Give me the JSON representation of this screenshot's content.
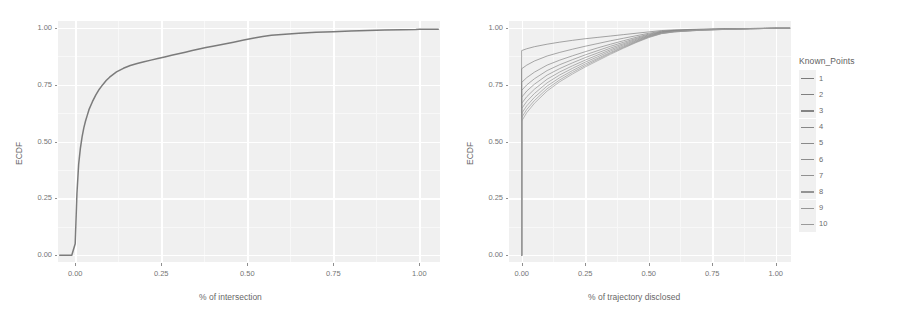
{
  "figure": {
    "background_color": "#ffffff",
    "panel_background_color": "#ececec",
    "gridline_color": "#ffffff",
    "curve_color": "#4a4a4a"
  },
  "legend": {
    "title": "Known_Points",
    "items": [
      {
        "label": "1",
        "color": "#575757"
      },
      {
        "label": "2",
        "color": "#5d5d5d"
      },
      {
        "label": "3",
        "color": "#626262"
      },
      {
        "label": "4",
        "color": "#666666"
      },
      {
        "label": "5",
        "color": "#6a6a6a"
      },
      {
        "label": "6",
        "color": "#6e6e6e"
      },
      {
        "label": "7",
        "color": "#727272"
      },
      {
        "label": "8",
        "color": "#767676"
      },
      {
        "label": "9",
        "color": "#7a7a7a"
      },
      {
        "label": "10",
        "color": "#7e7e7e"
      }
    ]
  },
  "chart_data": [
    {
      "type": "line",
      "panel": "left",
      "title": "",
      "xlabel": "% of intersection",
      "ylabel": "ECDF",
      "xlim": [
        -0.05,
        1.06
      ],
      "ylim": [
        -0.03,
        1.03
      ],
      "xticks": [
        0.0,
        0.25,
        0.5,
        0.75,
        1.0
      ],
      "xticklabels": [
        "0.00",
        "0.25",
        "0.50",
        "0.75",
        "1.00"
      ],
      "yticks": [
        0.0,
        0.25,
        0.5,
        0.75,
        1.0
      ],
      "yticklabels": [
        "0.00",
        "0.25",
        "0.50",
        "0.75",
        "1.00"
      ],
      "grid": true,
      "legend": false,
      "series": [
        {
          "name": "ECDF of % of intersection",
          "color": "#4a4a4a",
          "x": [
            -0.045,
            -0.01,
            0.0,
            0.002,
            0.005,
            0.01,
            0.015,
            0.02,
            0.025,
            0.03,
            0.035,
            0.04,
            0.05,
            0.06,
            0.07,
            0.08,
            0.09,
            0.1,
            0.12,
            0.14,
            0.16,
            0.18,
            0.2,
            0.22,
            0.24,
            0.26,
            0.28,
            0.3,
            0.32,
            0.34,
            0.36,
            0.38,
            0.4,
            0.43,
            0.46,
            0.49,
            0.52,
            0.545,
            0.57,
            0.6,
            0.65,
            0.7,
            0.75,
            0.8,
            0.85,
            0.9,
            0.95,
            0.99,
            1.0,
            1.055
          ],
          "y": [
            0.0,
            0.0,
            0.05,
            0.14,
            0.27,
            0.4,
            0.47,
            0.52,
            0.56,
            0.59,
            0.615,
            0.64,
            0.675,
            0.705,
            0.73,
            0.75,
            0.768,
            0.783,
            0.806,
            0.822,
            0.834,
            0.843,
            0.851,
            0.858,
            0.865,
            0.872,
            0.879,
            0.886,
            0.893,
            0.9,
            0.907,
            0.913,
            0.919,
            0.928,
            0.937,
            0.946,
            0.955,
            0.962,
            0.967,
            0.971,
            0.976,
            0.98,
            0.983,
            0.986,
            0.988,
            0.99,
            0.992,
            0.993,
            0.994,
            0.994
          ]
        }
      ]
    },
    {
      "type": "line",
      "panel": "right",
      "title": "",
      "xlabel": "% of trajectory disclosed",
      "ylabel": "ECDF",
      "xlim": [
        -0.05,
        1.06
      ],
      "ylim": [
        -0.03,
        1.03
      ],
      "xticks": [
        0.0,
        0.25,
        0.5,
        0.75,
        1.0
      ],
      "xticklabels": [
        "0.00",
        "0.25",
        "0.50",
        "0.75",
        "1.00"
      ],
      "yticks": [
        0.0,
        0.25,
        0.5,
        0.75,
        1.0
      ],
      "yticklabels": [
        "0.00",
        "0.25",
        "0.50",
        "0.75",
        "1.00"
      ],
      "grid": true,
      "legend": true,
      "legend_position": "right",
      "legend_title": "Known_Points",
      "series": [
        {
          "name": "1",
          "color": "#575757",
          "x": [
            0.0,
            0.0,
            0.02,
            0.05,
            0.1,
            0.15,
            0.2,
            0.25,
            0.3,
            0.35,
            0.4,
            0.45,
            0.5,
            0.55,
            0.6,
            0.7,
            0.8,
            0.9,
            1.0,
            1.055
          ],
          "y": [
            0.0,
            0.9,
            0.908,
            0.917,
            0.928,
            0.937,
            0.945,
            0.952,
            0.958,
            0.964,
            0.97,
            0.976,
            0.982,
            0.988,
            0.991,
            0.994,
            0.996,
            0.997,
            0.998,
            0.998
          ]
        },
        {
          "name": "2",
          "color": "#5d5d5d",
          "x": [
            0.0,
            0.0,
            0.02,
            0.05,
            0.1,
            0.15,
            0.2,
            0.25,
            0.3,
            0.35,
            0.4,
            0.45,
            0.5,
            0.55,
            0.6,
            0.7,
            0.8,
            0.9,
            1.0,
            1.055
          ],
          "y": [
            0.0,
            0.82,
            0.836,
            0.854,
            0.876,
            0.892,
            0.906,
            0.919,
            0.931,
            0.943,
            0.954,
            0.965,
            0.976,
            0.985,
            0.989,
            0.993,
            0.995,
            0.997,
            0.998,
            0.998
          ]
        },
        {
          "name": "3",
          "color": "#626262",
          "x": [
            0.0,
            0.0,
            0.02,
            0.05,
            0.1,
            0.15,
            0.2,
            0.25,
            0.3,
            0.35,
            0.4,
            0.45,
            0.5,
            0.55,
            0.6,
            0.7,
            0.8,
            0.9,
            1.0,
            1.055
          ],
          "y": [
            0.0,
            0.76,
            0.781,
            0.805,
            0.836,
            0.858,
            0.877,
            0.895,
            0.912,
            0.928,
            0.943,
            0.958,
            0.972,
            0.983,
            0.988,
            0.992,
            0.995,
            0.997,
            0.998,
            0.998
          ]
        },
        {
          "name": "4",
          "color": "#666666",
          "x": [
            0.0,
            0.0,
            0.02,
            0.05,
            0.1,
            0.15,
            0.2,
            0.25,
            0.3,
            0.35,
            0.4,
            0.45,
            0.5,
            0.55,
            0.6,
            0.7,
            0.8,
            0.9,
            1.0,
            1.055
          ],
          "y": [
            0.0,
            0.725,
            0.749,
            0.776,
            0.812,
            0.838,
            0.86,
            0.881,
            0.9,
            0.919,
            0.936,
            0.953,
            0.969,
            0.981,
            0.987,
            0.992,
            0.995,
            0.997,
            0.998,
            0.998
          ]
        },
        {
          "name": "5",
          "color": "#6a6a6a",
          "x": [
            0.0,
            0.0,
            0.02,
            0.05,
            0.1,
            0.15,
            0.2,
            0.25,
            0.3,
            0.35,
            0.4,
            0.45,
            0.5,
            0.55,
            0.6,
            0.7,
            0.8,
            0.9,
            1.0,
            1.055
          ],
          "y": [
            0.0,
            0.695,
            0.722,
            0.752,
            0.792,
            0.821,
            0.846,
            0.869,
            0.89,
            0.911,
            0.93,
            0.949,
            0.966,
            0.98,
            0.986,
            0.991,
            0.994,
            0.996,
            0.998,
            0.998
          ]
        },
        {
          "name": "6",
          "color": "#6e6e6e",
          "x": [
            0.0,
            0.0,
            0.02,
            0.05,
            0.1,
            0.15,
            0.2,
            0.25,
            0.3,
            0.35,
            0.4,
            0.45,
            0.5,
            0.55,
            0.6,
            0.7,
            0.8,
            0.9,
            1.0,
            1.055
          ],
          "y": [
            0.0,
            0.668,
            0.697,
            0.73,
            0.774,
            0.806,
            0.833,
            0.858,
            0.881,
            0.904,
            0.925,
            0.945,
            0.964,
            0.978,
            0.985,
            0.991,
            0.994,
            0.996,
            0.998,
            0.998
          ]
        },
        {
          "name": "7",
          "color": "#727272",
          "x": [
            0.0,
            0.0,
            0.02,
            0.05,
            0.1,
            0.15,
            0.2,
            0.25,
            0.3,
            0.35,
            0.4,
            0.45,
            0.5,
            0.55,
            0.6,
            0.7,
            0.8,
            0.9,
            1.0,
            1.055
          ],
          "y": [
            0.0,
            0.645,
            0.676,
            0.711,
            0.758,
            0.793,
            0.822,
            0.849,
            0.873,
            0.898,
            0.92,
            0.942,
            0.962,
            0.977,
            0.984,
            0.99,
            0.994,
            0.996,
            0.998,
            0.998
          ]
        },
        {
          "name": "8",
          "color": "#767676",
          "x": [
            0.0,
            0.0,
            0.02,
            0.05,
            0.1,
            0.15,
            0.2,
            0.25,
            0.3,
            0.35,
            0.4,
            0.45,
            0.5,
            0.55,
            0.6,
            0.7,
            0.8,
            0.9,
            1.0,
            1.055
          ],
          "y": [
            0.0,
            0.624,
            0.657,
            0.694,
            0.744,
            0.781,
            0.812,
            0.841,
            0.866,
            0.892,
            0.916,
            0.939,
            0.96,
            0.976,
            0.983,
            0.99,
            0.993,
            0.996,
            0.998,
            0.998
          ]
        },
        {
          "name": "9",
          "color": "#7a7a7a",
          "x": [
            0.0,
            0.0,
            0.02,
            0.05,
            0.1,
            0.15,
            0.2,
            0.25,
            0.3,
            0.35,
            0.4,
            0.45,
            0.5,
            0.55,
            0.6,
            0.7,
            0.8,
            0.9,
            1.0,
            1.055
          ],
          "y": [
            0.0,
            0.606,
            0.641,
            0.68,
            0.732,
            0.771,
            0.804,
            0.834,
            0.861,
            0.888,
            0.913,
            0.937,
            0.959,
            0.975,
            0.982,
            0.989,
            0.993,
            0.996,
            0.998,
            0.998
          ]
        },
        {
          "name": "10",
          "color": "#7e7e7e",
          "x": [
            0.0,
            0.0,
            0.02,
            0.05,
            0.1,
            0.15,
            0.2,
            0.25,
            0.3,
            0.35,
            0.4,
            0.45,
            0.5,
            0.55,
            0.6,
            0.7,
            0.8,
            0.9,
            1.0,
            1.055
          ],
          "y": [
            0.0,
            0.59,
            0.627,
            0.668,
            0.722,
            0.763,
            0.797,
            0.828,
            0.856,
            0.884,
            0.91,
            0.935,
            0.957,
            0.974,
            0.982,
            0.989,
            0.993,
            0.996,
            0.998,
            0.998
          ]
        }
      ]
    }
  ]
}
